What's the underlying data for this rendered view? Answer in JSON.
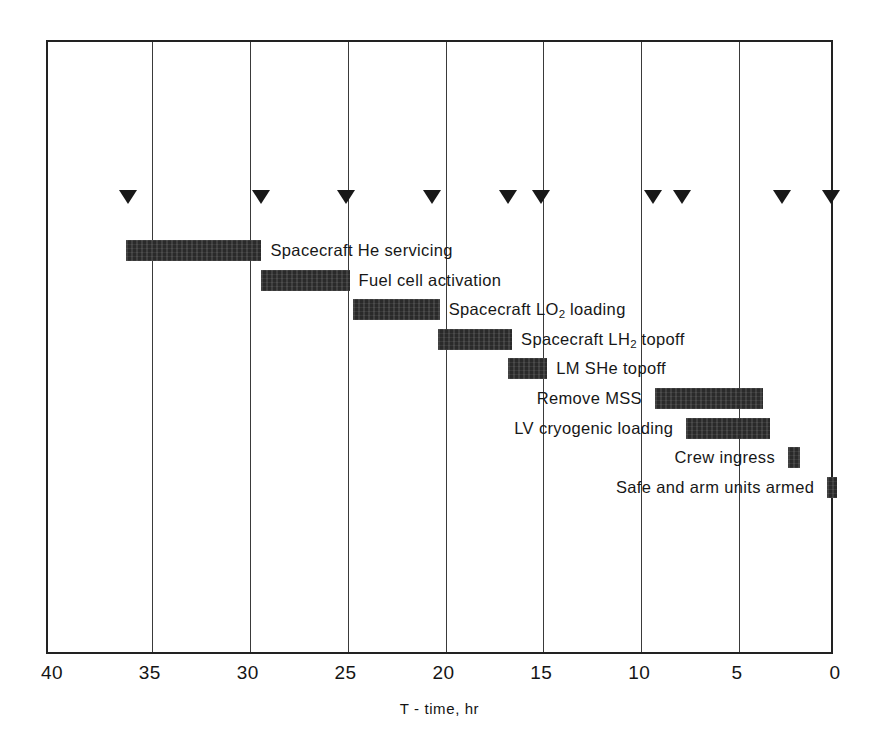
{
  "chart_data": {
    "type": "bar",
    "orientation": "horizontal-gantt",
    "title": "",
    "xlabel": "T - time, hr",
    "ylabel": "",
    "xlim": [
      40,
      0
    ],
    "x_axis_reversed": true,
    "grid": true,
    "legend": null,
    "x_ticks": [
      {
        "value": 40,
        "label": "40"
      },
      {
        "value": 35,
        "label": "35"
      },
      {
        "value": 30,
        "label": "30"
      },
      {
        "value": 25,
        "label": "25"
      },
      {
        "value": 20,
        "label": "20"
      },
      {
        "value": 15,
        "label": "15"
      },
      {
        "value": 10,
        "label": "10"
      },
      {
        "value": 5,
        "label": "5"
      },
      {
        "value": 0,
        "label": "0"
      }
    ],
    "gridline_values": [
      35,
      30,
      25,
      20,
      15,
      10,
      5
    ],
    "milestone_marker": "down-triangle",
    "milestones": [
      {
        "value": 36.2
      },
      {
        "value": 29.4
      },
      {
        "value": 25.1
      },
      {
        "value": 20.7
      },
      {
        "value": 16.8
      },
      {
        "value": 15.1
      },
      {
        "value": 9.4
      },
      {
        "value": 7.9
      },
      {
        "value": 2.8
      },
      {
        "value": 0.3
      }
    ],
    "categories": [
      "Spacecraft He servicing",
      "Fuel cell activation",
      "Spacecraft LO2 loading",
      "Spacecraft LH2 topoff",
      "LM SHe topoff",
      "Remove MSS",
      "LV cryogenic loading",
      "Crew ingress",
      "Safe and arm units armed"
    ],
    "tasks": [
      {
        "name": "Spacecraft He servicing",
        "label_html": "Spacecraft He servicing",
        "start_hr": 36.3,
        "end_hr": 29.4,
        "duration_hr": 6.9,
        "label_side": "right"
      },
      {
        "name": "Fuel cell activation",
        "label_html": "Fuel cell activation",
        "start_hr": 29.4,
        "end_hr": 24.9,
        "duration_hr": 4.5,
        "label_side": "right"
      },
      {
        "name": "Spacecraft LO2 loading",
        "label_html": "Spacecraft LO<sub>2</sub> loading",
        "start_hr": 24.7,
        "end_hr": 20.3,
        "duration_hr": 4.4,
        "label_side": "right"
      },
      {
        "name": "Spacecraft LH2 topoff",
        "label_html": "Spacecraft LH<sub>2</sub> topoff",
        "start_hr": 20.4,
        "end_hr": 16.6,
        "duration_hr": 3.8,
        "label_side": "right"
      },
      {
        "name": "LM SHe topoff",
        "label_html": "LM SHe topoff",
        "start_hr": 16.8,
        "end_hr": 14.8,
        "duration_hr": 2.0,
        "label_side": "right"
      },
      {
        "name": "Remove MSS",
        "label_html": "Remove MSS",
        "start_hr": 9.3,
        "end_hr": 3.8,
        "duration_hr": 5.5,
        "label_side": "left"
      },
      {
        "name": "LV cryogenic loading",
        "label_html": "LV cryogenic loading",
        "start_hr": 7.7,
        "end_hr": 3.4,
        "duration_hr": 4.3,
        "label_side": "left"
      },
      {
        "name": "Crew ingress",
        "label_html": "Crew ingress",
        "start_hr": 2.5,
        "end_hr": 1.9,
        "duration_hr": 0.6,
        "label_side": "left"
      },
      {
        "name": "Safe and arm units armed",
        "label_html": "Safe and arm units armed",
        "start_hr": 0.5,
        "end_hr": 0.0,
        "duration_hr": 0.5,
        "label_side": "left"
      }
    ],
    "colors": {
      "bar": "#2a2a2a",
      "frame": "#222222",
      "grid": "#3a3a3a",
      "marker": "#181818",
      "text": "#141414",
      "background": "#ffffff"
    }
  }
}
